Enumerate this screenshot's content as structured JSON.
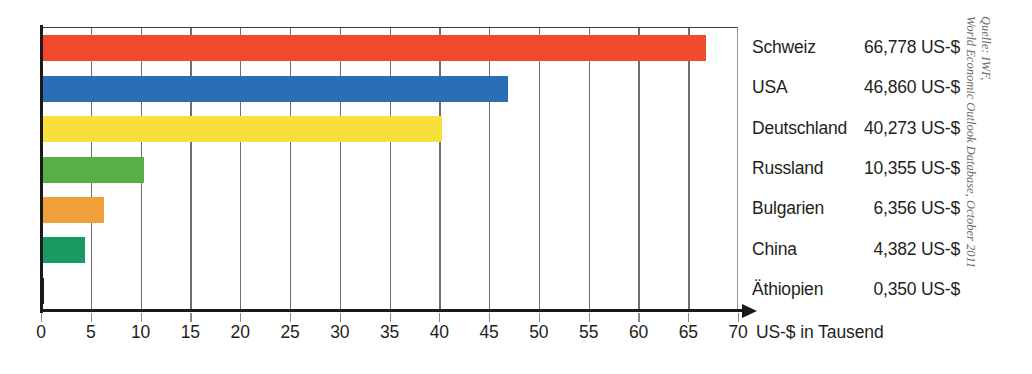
{
  "chart_data": {
    "type": "bar",
    "orientation": "horizontal",
    "title": "",
    "xlabel": "US-$ in Tausend",
    "ylabel": "",
    "xlim": [
      0,
      70
    ],
    "xticks": [
      0,
      5,
      10,
      15,
      20,
      25,
      30,
      35,
      40,
      45,
      50,
      55,
      60,
      65,
      70
    ],
    "xtick_labels": [
      "0",
      "5",
      "10",
      "15",
      "20",
      "25",
      "30",
      "35",
      "40",
      "45",
      "50",
      "55",
      "60",
      "65",
      "70"
    ],
    "grid": true,
    "grid_axis": "x",
    "legend": "none",
    "units": "US-$ in Tausend",
    "categories": [
      "Schweiz",
      "USA",
      "Deutschland",
      "Russland",
      "Bulgarien",
      "China",
      "Äthiopien"
    ],
    "values": [
      66.778,
      46.86,
      40.273,
      10.355,
      6.356,
      4.382,
      0.35
    ],
    "value_labels": [
      "66,778 US-$",
      "46,860 US-$",
      "40,273 US-$",
      "10,355 US-$",
      "6,356 US-$",
      "4,382 US-$",
      "0,350 US-$"
    ],
    "colors": [
      "#EF4B2C",
      "#2B6EB5",
      "#F7E03C",
      "#5AAE46",
      "#EFA03A",
      "#199A5E",
      "#1C1C1C"
    ],
    "bars": [
      {
        "label": "Schweiz",
        "value": 66.778,
        "value_label": "66,778 US-$",
        "color": "#EF4B2C"
      },
      {
        "label": "USA",
        "value": 46.86,
        "value_label": "46,860 US-$",
        "color": "#2B6EB5"
      },
      {
        "label": "Deutschland",
        "value": 40.273,
        "value_label": "40,273 US-$",
        "color": "#F7E03C"
      },
      {
        "label": "Russland",
        "value": 10.355,
        "value_label": "10,355 US-$",
        "color": "#5AAE46"
      },
      {
        "label": "Bulgarien",
        "value": 6.356,
        "value_label": "6,356 US-$",
        "color": "#EFA03A"
      },
      {
        "label": "China",
        "value": 4.382,
        "value_label": "4,382 US-$",
        "color": "#199A5E"
      },
      {
        "label": "Äthiopien",
        "value": 0.35,
        "value_label": "0,350 US-$",
        "color": "#1C1C1C"
      }
    ],
    "source": {
      "line1": "Quelle: IWF,",
      "line2": "World Economic Outlook Database, October 2011"
    }
  }
}
